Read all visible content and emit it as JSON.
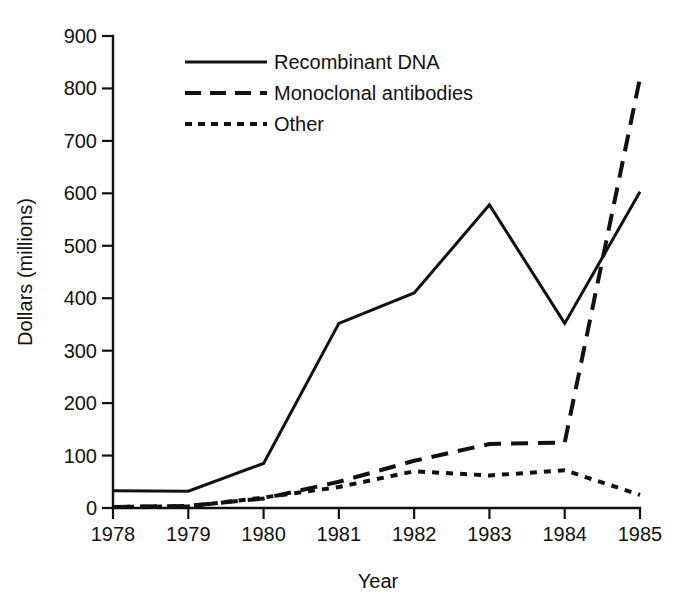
{
  "chart_data": {
    "type": "line",
    "title": "",
    "xlabel": "Year",
    "ylabel": "Dollars (millions)",
    "x": [
      1978,
      1979,
      1980,
      1981,
      1982,
      1983,
      1984,
      1985
    ],
    "xticklabels": [
      "1978",
      "1979",
      "1980",
      "1981",
      "1982",
      "1983",
      "1984",
      "1985"
    ],
    "xlim": [
      1978,
      1985
    ],
    "ylim": [
      0,
      900
    ],
    "yticks": [
      0,
      100,
      200,
      300,
      400,
      500,
      600,
      700,
      800,
      900
    ],
    "yticklabels": [
      "0",
      "100",
      "200",
      "300",
      "400",
      "500",
      "600",
      "700",
      "800",
      "900"
    ],
    "grid": false,
    "legend_position": "upper center",
    "series": [
      {
        "name": "Recombinant DNA",
        "style": "solid",
        "color": "#111111",
        "values": [
          33,
          32,
          85,
          352,
          410,
          578,
          352,
          603
        ]
      },
      {
        "name": "Monoclonal antibodies",
        "style": "dashed",
        "color": "#111111",
        "values": [
          2,
          4,
          18,
          50,
          90,
          122,
          125,
          820
        ]
      },
      {
        "name": "Other",
        "style": "dotted",
        "color": "#111111",
        "values": [
          2,
          3,
          20,
          40,
          70,
          62,
          72,
          25
        ]
      }
    ]
  },
  "legend": {
    "items": [
      {
        "label": "Recombinant DNA",
        "style": "solid"
      },
      {
        "label": "Monoclonal antibodies",
        "style": "dashed"
      },
      {
        "label": "Other",
        "style": "dotted"
      }
    ]
  },
  "axes": {
    "y_title": "Dollars (millions)",
    "x_title": "Year"
  }
}
